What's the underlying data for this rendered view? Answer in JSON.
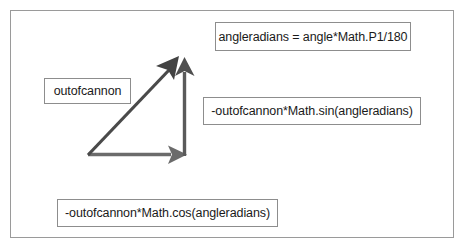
{
  "figure": {
    "frame": {
      "border_color": "#9a9a9a",
      "background_color": "#ffffff"
    }
  },
  "labels": {
    "angleradians": {
      "text": "angleradians = angle*Math.P1/180",
      "name": "angleradians-formula"
    },
    "outofcannon": {
      "text": "outofcannon",
      "name": "outofcannon-magnitude"
    },
    "sin_component": {
      "text": "-outofcannon*Math.sin(angleradians)",
      "name": "vertical-component-formula"
    },
    "cos_component": {
      "text": "-outofcannon*Math.cos(angleradians)",
      "name": "horizontal-component-formula"
    }
  },
  "vectors": {
    "hypotenuse": {
      "label": "outofcannon",
      "color": "#4a4a4a",
      "origin": [
        88,
        155
      ],
      "tip": [
        178,
        58
      ],
      "stroke_width": 3.2
    },
    "vertical": {
      "label": "-outofcannon*Math.sin(angleradians)",
      "color": "#5a5a5a",
      "origin": [
        185,
        155
      ],
      "tip": [
        185,
        60
      ],
      "stroke_width": 3.4
    },
    "horizontal": {
      "label": "-outofcannon*Math.cos(angleradians)",
      "color": "#6b6b6b",
      "origin": [
        88,
        155
      ],
      "tip": [
        186,
        155
      ],
      "stroke_width": 3.4
    }
  },
  "colors": {
    "frame_border": "#9a9a9a",
    "box_border": "#8d8d8d",
    "text": "#1a1a1a",
    "arrow_dark": "#4a4a4a",
    "arrow_mid": "#5a5a5a",
    "arrow_light": "#6b6b6b",
    "background": "#ffffff"
  }
}
